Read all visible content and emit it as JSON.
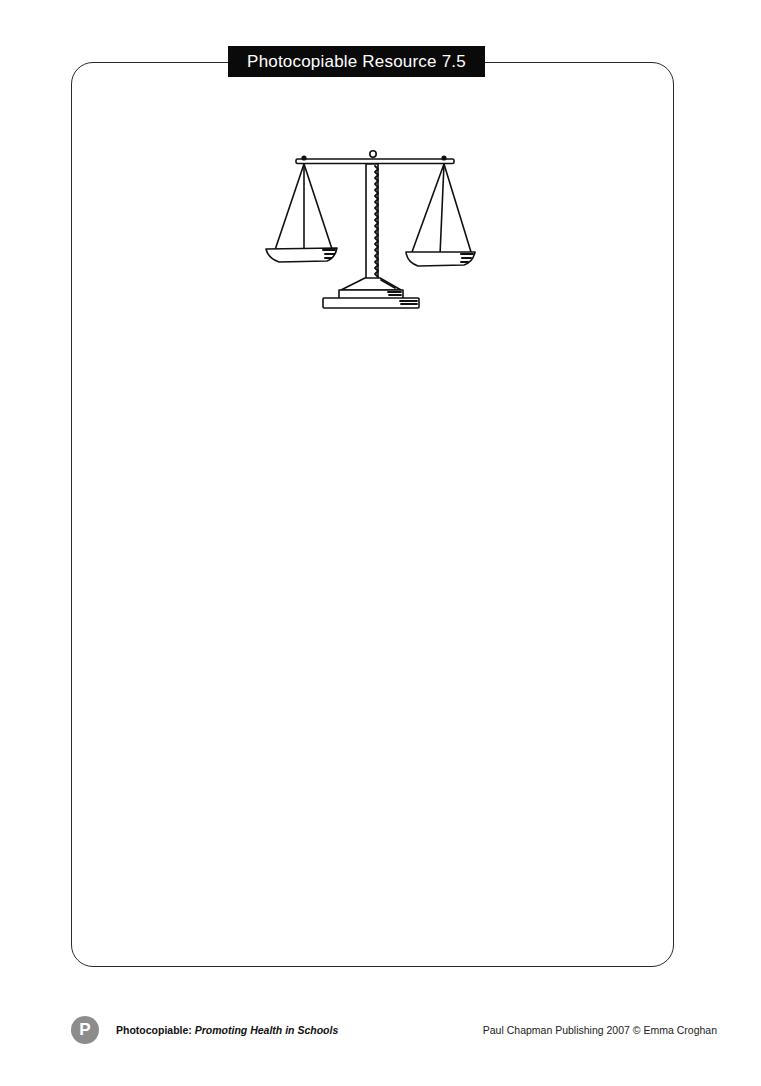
{
  "header": {
    "label": "Photocopiable Resource 7.5"
  },
  "illustration": {
    "icon": "balance-scales-icon"
  },
  "footer": {
    "badge_letter": "P",
    "left_prefix": "Photocopiable: ",
    "left_title": "Promoting Health in Schools",
    "right_text": "Paul Chapman Publishing 2007 © Emma Croghan"
  }
}
